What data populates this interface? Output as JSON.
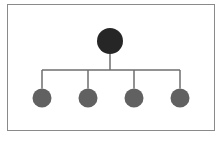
{
  "diagram": {
    "type": "hierarchy",
    "colors": {
      "frame": "#8a8a8a",
      "root": "#262626",
      "child": "#616161",
      "connector": "#6e6e6e"
    },
    "root": {
      "id": "root",
      "label": "",
      "cx": 110,
      "cy": 41,
      "r": 13
    },
    "bus_y": 70,
    "children": [
      {
        "id": "child-1",
        "label": "",
        "cx": 42,
        "cy": 98,
        "r": 9.5
      },
      {
        "id": "child-2",
        "label": "",
        "cx": 88,
        "cy": 98,
        "r": 9.5
      },
      {
        "id": "child-3",
        "label": "",
        "cx": 134,
        "cy": 98,
        "r": 9.5
      },
      {
        "id": "child-4",
        "label": "",
        "cx": 180,
        "cy": 98,
        "r": 9.5
      }
    ]
  }
}
